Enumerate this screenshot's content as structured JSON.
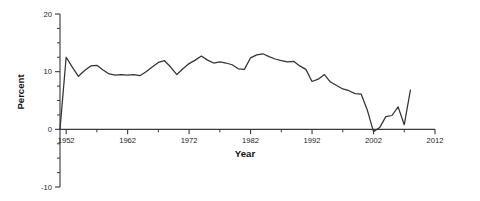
{
  "chart_data": {
    "type": "line",
    "title": "",
    "xlabel": "Year",
    "ylabel": "Percent",
    "xlim": [
      1951,
      2012
    ],
    "ylim": [
      -10,
      20
    ],
    "grid": false,
    "legend": null,
    "x_ticks": [
      1952,
      1962,
      1972,
      1982,
      1992,
      2002,
      2012
    ],
    "x_tick_labels": [
      "1952",
      "1962",
      "1972",
      "1982",
      "1992",
      "2002",
      "2012"
    ],
    "x_minor_tick_interval": 5,
    "y_ticks": [
      -10,
      0,
      10,
      20
    ],
    "y_tick_labels": [
      "-10",
      "0",
      "10",
      "20"
    ],
    "y_minor_tick_interval": 2.5,
    "line_color": "#333333",
    "series": [
      {
        "name": "Percent",
        "x": [
          1951,
          1952,
          1953,
          1954,
          1955,
          1956,
          1957,
          1958,
          1959,
          1960,
          1961,
          1962,
          1963,
          1964,
          1965,
          1966,
          1967,
          1968,
          1969,
          1970,
          1971,
          1972,
          1973,
          1974,
          1975,
          1976,
          1977,
          1978,
          1979,
          1980,
          1981,
          1982,
          1983,
          1984,
          1985,
          1986,
          1987,
          1988,
          1989,
          1990,
          1991,
          1992,
          1993,
          1994,
          1995,
          1996,
          1997,
          1998,
          1999,
          2000,
          2001,
          2002,
          2003,
          2004,
          2005,
          2006,
          2007,
          2008
        ],
        "values": [
          0.0,
          12.5,
          10.8,
          9.2,
          10.2,
          11.0,
          11.1,
          10.3,
          9.6,
          9.4,
          9.5,
          9.4,
          9.5,
          9.3,
          10.0,
          10.8,
          11.6,
          11.9,
          10.8,
          9.5,
          10.5,
          11.4,
          12.0,
          12.7,
          12.0,
          11.5,
          11.7,
          11.5,
          11.2,
          10.5,
          10.4,
          12.4,
          12.9,
          13.1,
          12.6,
          12.2,
          11.9,
          11.7,
          11.8,
          11.0,
          10.4,
          8.3,
          8.7,
          9.5,
          8.2,
          7.6,
          7.0,
          6.7,
          6.2,
          6.1,
          3.3,
          -0.4,
          0.3,
          2.2,
          2.4,
          3.9,
          0.8,
          6.8
        ]
      }
    ]
  },
  "chart_meta": {
    "axis_title_x": "Year",
    "axis_title_y": "Percent"
  }
}
